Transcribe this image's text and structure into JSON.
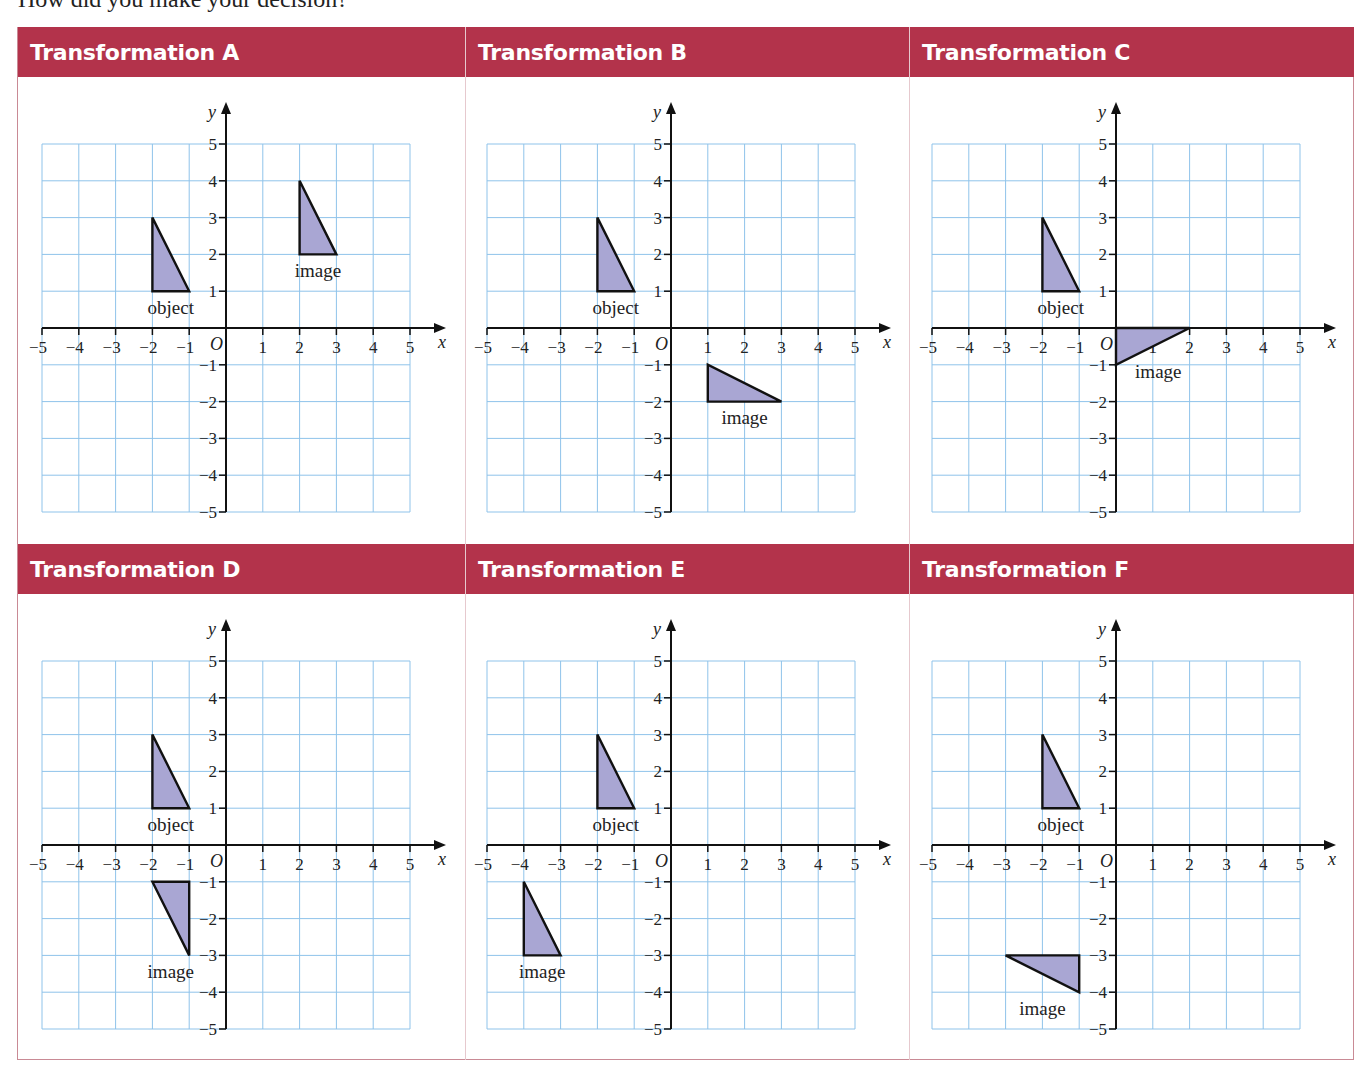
{
  "intro_text": "How did you make your decision?",
  "colors": {
    "header_bg": "#b3334b",
    "header_text": "#ffffff",
    "grid_line": "#8fc3ea",
    "shape_fill": "#a9a6d3",
    "shape_stroke": "#111111",
    "border": "#c98a95"
  },
  "axes": {
    "x_label": "x",
    "y_label": "y",
    "origin_label": "O",
    "x_range": [
      -5,
      5
    ],
    "y_range": [
      -5,
      5
    ]
  },
  "labels": {
    "object": "object",
    "image": "image"
  },
  "object": {
    "vertices": [
      [
        -2,
        3
      ],
      [
        -2,
        1
      ],
      [
        -1,
        1
      ]
    ],
    "label_pos": [
      -1.5,
      0.55
    ]
  },
  "panels": [
    {
      "id": "A",
      "title": "Transformation A",
      "image": {
        "vertices": [
          [
            2,
            4
          ],
          [
            2,
            2
          ],
          [
            3,
            2
          ]
        ],
        "label_pos": [
          2.5,
          1.55
        ]
      }
    },
    {
      "id": "B",
      "title": "Transformation B",
      "image": {
        "vertices": [
          [
            1,
            -1
          ],
          [
            1,
            -2
          ],
          [
            3,
            -2
          ]
        ],
        "label_pos": [
          2.0,
          -2.45
        ]
      }
    },
    {
      "id": "C",
      "title": "Transformation C",
      "image": {
        "vertices": [
          [
            0,
            0
          ],
          [
            2,
            0
          ],
          [
            0,
            -1
          ]
        ],
        "label_pos": [
          1.15,
          -1.2
        ]
      }
    },
    {
      "id": "D",
      "title": "Transformation D",
      "image": {
        "vertices": [
          [
            -2,
            -1
          ],
          [
            -1,
            -1
          ],
          [
            -1,
            -3
          ]
        ],
        "label_pos": [
          -1.5,
          -3.45
        ]
      }
    },
    {
      "id": "E",
      "title": "Transformation E",
      "image": {
        "vertices": [
          [
            -4,
            -1
          ],
          [
            -4,
            -3
          ],
          [
            -3,
            -3
          ]
        ],
        "label_pos": [
          -3.5,
          -3.45
        ]
      }
    },
    {
      "id": "F",
      "title": "Transformation F",
      "image": {
        "vertices": [
          [
            -3,
            -3
          ],
          [
            -1,
            -3
          ],
          [
            -1,
            -4
          ]
        ],
        "label_pos": [
          -2.0,
          -4.45
        ]
      }
    }
  ]
}
